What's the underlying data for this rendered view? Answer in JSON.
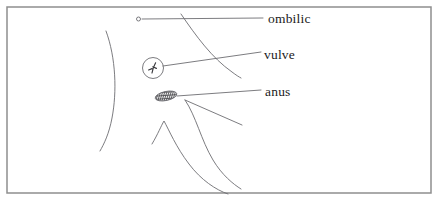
{
  "figure": {
    "kind": "anatomical-line-drawing",
    "caption_language": "French",
    "background_color": "#ffffff",
    "border": {
      "present": true,
      "color": "#8e8e8e",
      "width_px": 1.5,
      "rect": {
        "x": 7,
        "y": 7,
        "width": 424,
        "height": 186
      }
    },
    "stroke_color": "#6d6d72",
    "stroke_width_px": 0.9,
    "text_color": "#1b1b1b"
  },
  "labels": [
    {
      "id": "ombilic",
      "text": "ombilic",
      "x": 268,
      "y": 12,
      "leader_from": {
        "x": 142,
        "y": 19
      },
      "leader_to": {
        "x": 263,
        "y": 18
      }
    },
    {
      "id": "vulve",
      "text": "vulve",
      "x": 264,
      "y": 48,
      "leader_from": {
        "x": 163,
        "y": 66
      },
      "leader_to": {
        "x": 261,
        "y": 52
      }
    },
    {
      "id": "anus",
      "text": "anus",
      "x": 265,
      "y": 85,
      "leader_from": {
        "x": 177,
        "y": 96
      },
      "leader_to": {
        "x": 261,
        "y": 90
      }
    }
  ],
  "markers": {
    "ombilic_dot": {
      "cx": 138.5,
      "cy": 19,
      "r": 2
    },
    "vulve_circle": {
      "cx": 153,
      "cy": 68,
      "r": 10.5
    },
    "anus_oval": {
      "cx": 166,
      "cy": 96,
      "rx": 11,
      "ry": 4.5,
      "rotation_deg": -12,
      "hatch": true
    }
  },
  "body_outlines": [
    {
      "id": "flank-left-curve",
      "d": "M 106 31 C 116 58, 117 92, 112 118 C 109 134, 104 144, 100 151"
    },
    {
      "id": "udder-right-curve",
      "d": "M 181 14 C 196 36, 212 58, 232 72 C 236 75, 239 77, 241 78"
    },
    {
      "id": "hind-leg-inner-curve",
      "d": "M 185 100 C 196 116, 201 140, 213 160 C 222 175, 233 184, 241 189"
    },
    {
      "id": "hind-leg-outer-curve",
      "d": "M 152 144 C 158 134, 161 126, 164 121 C 169 130, 176 147, 189 164 C 201 180, 216 190, 228 194"
    },
    {
      "id": "tail-leader-stroke",
      "d": "M 185 100 L 242 125"
    }
  ]
}
